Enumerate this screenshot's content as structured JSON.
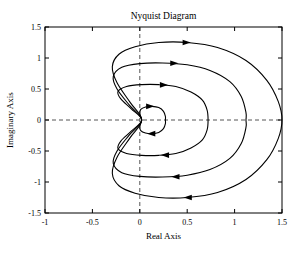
{
  "chart_data": {
    "type": "line",
    "title": "Nyquist Diagram",
    "xlabel": "Real Axis",
    "ylabel": "Imaginary Axis",
    "xlim": [
      -1,
      1.5
    ],
    "ylim": [
      -1.5,
      1.5
    ],
    "grid": false,
    "zero_lines": "dashed",
    "legend": "none",
    "xticks": [
      -1,
      -0.5,
      0,
      0.5,
      1,
      1.5
    ],
    "xticklabels": [
      "-1",
      "-0.5",
      "0",
      "0.5",
      "1",
      "1.5"
    ],
    "yticks": [
      -1.5,
      -1,
      -0.5,
      0,
      0.5,
      1,
      1.5
    ],
    "yticklabels": [
      "-1.5",
      "-1",
      "-0.5",
      "0",
      "0.5",
      "1",
      "1.5"
    ],
    "line_color": "#000000",
    "direction": "clockwise",
    "series": [
      {
        "name": "curve-1-outer",
        "real_axis_crossing": 1.5,
        "peak_imaginary": 1.25,
        "min_imaginary": -1.25,
        "leftmost_real": -0.3,
        "points": [
          [
            0.02,
            0.0
          ],
          [
            -0.1,
            0.28
          ],
          [
            -0.24,
            0.6
          ],
          [
            -0.29,
            0.86
          ],
          [
            -0.22,
            1.06
          ],
          [
            -0.05,
            1.18
          ],
          [
            0.2,
            1.25
          ],
          [
            0.5,
            1.25
          ],
          [
            0.82,
            1.17
          ],
          [
            1.12,
            0.96
          ],
          [
            1.34,
            0.64
          ],
          [
            1.46,
            0.3
          ],
          [
            1.5,
            0.0
          ],
          [
            1.46,
            -0.3
          ],
          [
            1.34,
            -0.64
          ],
          [
            1.12,
            -0.96
          ],
          [
            0.82,
            -1.17
          ],
          [
            0.5,
            -1.25
          ],
          [
            0.2,
            -1.25
          ],
          [
            -0.05,
            -1.18
          ],
          [
            -0.22,
            -1.06
          ],
          [
            -0.29,
            -0.86
          ],
          [
            -0.24,
            -0.6
          ],
          [
            -0.1,
            -0.28
          ],
          [
            0.02,
            0.0
          ]
        ],
        "arrows": [
          {
            "real": 0.5,
            "imaginary": 1.25,
            "angle": 0
          },
          {
            "real": 0.5,
            "imaginary": -1.25,
            "angle": 180
          }
        ]
      },
      {
        "name": "curve-2",
        "real_axis_crossing": 1.12,
        "peak_imaginary": 0.92,
        "min_imaginary": -0.92,
        "leftmost_real": -0.29,
        "points": [
          [
            0.02,
            0.0
          ],
          [
            -0.11,
            0.24
          ],
          [
            -0.24,
            0.5
          ],
          [
            -0.28,
            0.7
          ],
          [
            -0.19,
            0.85
          ],
          [
            0.0,
            0.91
          ],
          [
            0.24,
            0.92
          ],
          [
            0.5,
            0.89
          ],
          [
            0.74,
            0.8
          ],
          [
            0.95,
            0.62
          ],
          [
            1.07,
            0.38
          ],
          [
            1.12,
            0.12
          ],
          [
            1.12,
            0.0
          ],
          [
            1.12,
            -0.12
          ],
          [
            1.07,
            -0.38
          ],
          [
            0.95,
            -0.62
          ],
          [
            0.74,
            -0.8
          ],
          [
            0.5,
            -0.89
          ],
          [
            0.24,
            -0.92
          ],
          [
            0.0,
            -0.91
          ],
          [
            -0.19,
            -0.85
          ],
          [
            -0.28,
            -0.7
          ],
          [
            -0.24,
            -0.5
          ],
          [
            -0.11,
            -0.24
          ],
          [
            0.02,
            0.0
          ]
        ],
        "arrows": [
          {
            "real": 0.37,
            "imaginary": 0.915,
            "angle": 0
          },
          {
            "real": 0.37,
            "imaginary": -0.915,
            "angle": 180
          }
        ]
      },
      {
        "name": "curve-3",
        "real_axis_crossing": 0.72,
        "peak_imaginary": 0.57,
        "min_imaginary": -0.57,
        "leftmost_real": -0.24,
        "points": [
          [
            0.02,
            0.0
          ],
          [
            -0.09,
            0.18
          ],
          [
            -0.2,
            0.34
          ],
          [
            -0.23,
            0.46
          ],
          [
            -0.14,
            0.54
          ],
          [
            0.02,
            0.57
          ],
          [
            0.2,
            0.57
          ],
          [
            0.38,
            0.54
          ],
          [
            0.54,
            0.45
          ],
          [
            0.66,
            0.32
          ],
          [
            0.71,
            0.16
          ],
          [
            0.72,
            0.0
          ],
          [
            0.71,
            -0.16
          ],
          [
            0.66,
            -0.32
          ],
          [
            0.54,
            -0.45
          ],
          [
            0.38,
            -0.54
          ],
          [
            0.2,
            -0.57
          ],
          [
            0.02,
            -0.57
          ],
          [
            -0.14,
            -0.54
          ],
          [
            -0.23,
            -0.46
          ],
          [
            -0.2,
            -0.34
          ],
          [
            -0.09,
            -0.18
          ],
          [
            0.02,
            0.0
          ]
        ],
        "arrows": [
          {
            "real": 0.26,
            "imaginary": 0.565,
            "angle": 0
          },
          {
            "real": 0.26,
            "imaginary": -0.565,
            "angle": 180
          }
        ]
      },
      {
        "name": "curve-4-inner",
        "real_axis_crossing": 0.27,
        "peak_imaginary": 0.22,
        "min_imaginary": -0.22,
        "leftmost_real": -0.04,
        "points": [
          [
            0.02,
            0.0
          ],
          [
            0.0,
            0.1
          ],
          [
            0.01,
            0.17
          ],
          [
            0.06,
            0.21
          ],
          [
            0.13,
            0.22
          ],
          [
            0.2,
            0.2
          ],
          [
            0.25,
            0.14
          ],
          [
            0.27,
            0.06
          ],
          [
            0.27,
            0.0
          ],
          [
            0.27,
            -0.06
          ],
          [
            0.25,
            -0.14
          ],
          [
            0.2,
            -0.2
          ],
          [
            0.13,
            -0.22
          ],
          [
            0.06,
            -0.21
          ],
          [
            0.01,
            -0.17
          ],
          [
            0.0,
            -0.1
          ],
          [
            0.02,
            0.0
          ]
        ],
        "arrows": [
          {
            "real": 0.115,
            "imaginary": 0.22,
            "angle": 0
          },
          {
            "real": 0.115,
            "imaginary": -0.22,
            "angle": 180
          }
        ]
      }
    ]
  },
  "axes": {
    "title": "Nyquist Diagram",
    "xlabel": "Real Axis",
    "ylabel": "Imaginary Axis"
  }
}
